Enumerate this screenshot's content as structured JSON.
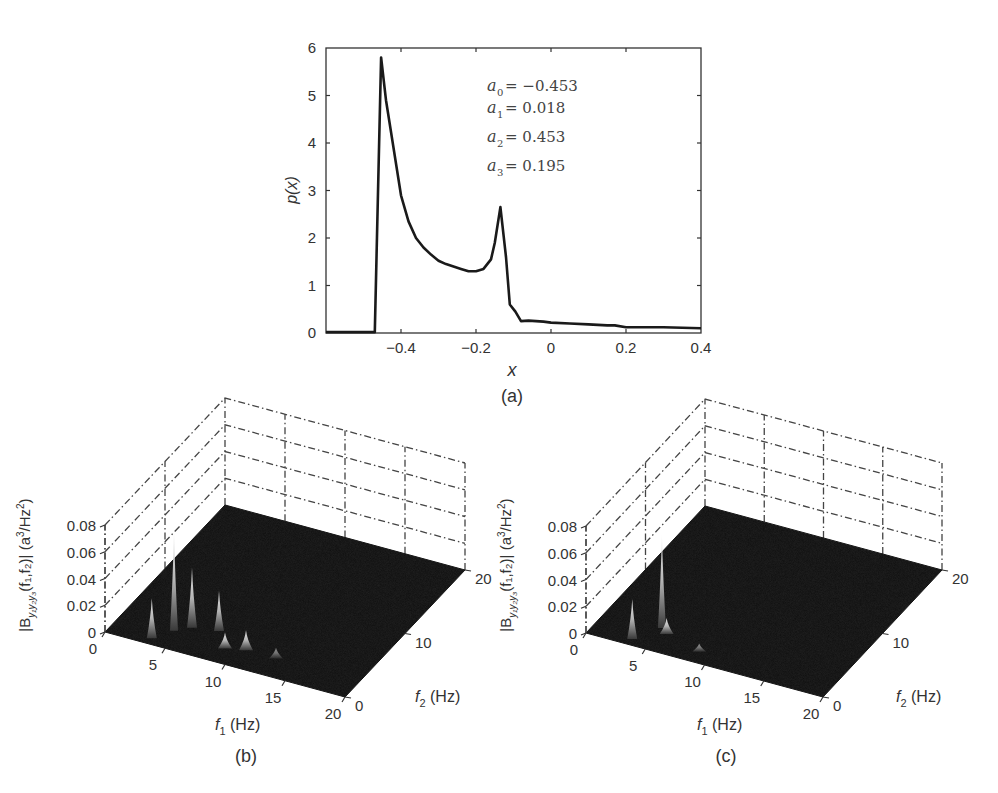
{
  "chart_data": [
    {
      "id": "a",
      "type": "line",
      "caption": "(a)",
      "xlabel": "x",
      "ylabel": "p(x)",
      "xlim": [
        -0.6,
        0.4
      ],
      "ylim": [
        0,
        6
      ],
      "xticks": [
        -0.4,
        -0.2,
        0,
        0.2,
        0.4
      ],
      "xtick_labels": [
        "-0.4",
        "-0.2",
        "0",
        "0.2",
        "0.4"
      ],
      "yticks": [
        0,
        1,
        2,
        3,
        4,
        5,
        6
      ],
      "ytick_labels": [
        "0",
        "1",
        "2",
        "3",
        "4",
        "5",
        "6"
      ],
      "grid": false,
      "legend": null,
      "annotations": [
        {
          "var": "a",
          "sub": "0",
          "text": " = −0.453"
        },
        {
          "var": "a",
          "sub": "1",
          "text": " = 0.018"
        },
        {
          "var": "a",
          "sub": "2",
          "text": " = 0.453"
        },
        {
          "var": "a",
          "sub": "3",
          "text": " = 0.195"
        }
      ],
      "series": [
        {
          "name": "p(x)",
          "x": [
            -0.6,
            -0.47,
            -0.453,
            -0.44,
            -0.42,
            -0.4,
            -0.38,
            -0.36,
            -0.34,
            -0.32,
            -0.3,
            -0.28,
            -0.26,
            -0.24,
            -0.22,
            -0.2,
            -0.18,
            -0.16,
            -0.15,
            -0.135,
            -0.12,
            -0.11,
            -0.095,
            -0.08,
            -0.06,
            -0.04,
            -0.02,
            0.0,
            0.05,
            0.1,
            0.15,
            0.17,
            0.2,
            0.25,
            0.3,
            0.35,
            0.4
          ],
          "y": [
            0.02,
            0.02,
            5.8,
            4.9,
            3.9,
            2.9,
            2.35,
            2.0,
            1.8,
            1.65,
            1.52,
            1.45,
            1.4,
            1.35,
            1.3,
            1.3,
            1.35,
            1.55,
            1.9,
            2.65,
            1.6,
            0.6,
            0.45,
            0.25,
            0.26,
            0.25,
            0.24,
            0.22,
            0.2,
            0.18,
            0.16,
            0.16,
            0.12,
            0.12,
            0.12,
            0.11,
            0.1
          ]
        }
      ]
    },
    {
      "id": "b",
      "type": "surface",
      "caption": "(b)",
      "xlabel": "f1 (Hz)",
      "ylabel": "f2 (Hz)",
      "zlabel": "|B y1y2y3 (f1,f2)| (a^3/Hz^2)",
      "xlim": [
        0,
        20
      ],
      "ylim": [
        0,
        20
      ],
      "zlim": [
        0,
        0.08
      ],
      "xticks": [
        0,
        5,
        10,
        15,
        20
      ],
      "yticks": [
        0,
        10,
        20
      ],
      "zticks": [
        0,
        0.02,
        0.04,
        0.06,
        0.08
      ],
      "ztick_labels": [
        "0",
        "0.02",
        "0.04",
        "0.06",
        "0.08"
      ],
      "grid": true,
      "peaks": [
        {
          "f1": 4.5,
          "f2": 2.5,
          "z": 0.075
        },
        {
          "f1": 5.5,
          "f2": 3.5,
          "z": 0.045
        },
        {
          "f1": 3.5,
          "f2": 0.8,
          "z": 0.03
        },
        {
          "f1": 7.5,
          "f2": 4.0,
          "z": 0.03
        },
        {
          "f1": 9.0,
          "f2": 2.0,
          "z": 0.012
        },
        {
          "f1": 10.5,
          "f2": 2.5,
          "z": 0.015
        },
        {
          "f1": 13.0,
          "f2": 2.5,
          "z": 0.008
        }
      ]
    },
    {
      "id": "c",
      "type": "surface",
      "caption": "(c)",
      "xlabel": "f1 (Hz)",
      "ylabel": "f2 (Hz)",
      "zlabel": "|B y1y2y3 (f1,f2)| (a^3/Hz^2)",
      "xlim": [
        0,
        20
      ],
      "ylim": [
        0,
        20
      ],
      "zlim": [
        0,
        0.08
      ],
      "xticks": [
        0,
        5,
        10,
        15,
        20
      ],
      "yticks": [
        0,
        10,
        20
      ],
      "zticks": [
        0,
        0.02,
        0.04,
        0.06,
        0.08
      ],
      "ztick_labels": [
        "0",
        "0.02",
        "0.04",
        "0.06",
        "0.08"
      ],
      "grid": true,
      "peaks": [
        {
          "f1": 4.8,
          "f2": 3.2,
          "z": 0.07
        },
        {
          "f1": 3.5,
          "f2": 0.8,
          "z": 0.03
        },
        {
          "f1": 5.5,
          "f2": 2.6,
          "z": 0.012
        },
        {
          "f1": 8.8,
          "f2": 1.5,
          "z": 0.006
        }
      ]
    }
  ],
  "labels": {
    "a_caption": "(a)",
    "b_caption": "(b)",
    "c_caption": "(c)",
    "x_axis": "x",
    "p_axis": "p(x)",
    "f1": "f",
    "f1_sub": "1",
    "f2": "f",
    "f2_sub": "2",
    "hz": " (Hz)",
    "zlabel_prefix": "|B",
    "zlabel_sub": "y₁y₂y₃",
    "zlabel_args": "(f₁,f₂)| (a",
    "zlabel_sup3": "3",
    "zlabel_mid": "/Hz",
    "zlabel_sup2": "2",
    "zlabel_end": ")"
  },
  "colors": {
    "line": "#1a1a1a",
    "axis": "#333333",
    "surface_floor": "#0d0d0d",
    "peak_light": "#f0f0f0"
  }
}
